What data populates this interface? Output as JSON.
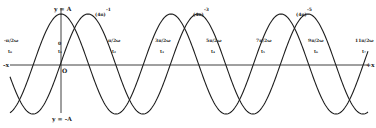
{
  "figure": {
    "type": "displacement-time diagram of two phase-shifted sinusoids",
    "colors": {
      "background": "#ffffff",
      "ink": "#1e1e1e"
    },
    "axes": {
      "x_left_label": "-x",
      "x_right_label": "+x",
      "origin_label": "O",
      "y_top_label": "y = A",
      "y_bottom_label": "y = -A"
    },
    "peak_labels": [
      {
        "text": "(4n)",
        "sup": "-1"
      },
      {
        "text": "(4n)",
        "sup": "-3"
      },
      {
        "text": "(4n)",
        "sup": "-5"
      }
    ],
    "tick_labels": [
      {
        "top": "-π/2ω",
        "bottom": "t₀"
      },
      {
        "top": "0",
        "bottom": "t₁"
      },
      {
        "top": "π/2ω",
        "bottom": "t₂"
      },
      {
        "top": "3π/2ω",
        "bottom": "t₃"
      },
      {
        "top": "5π/2ω",
        "bottom": "t₄"
      },
      {
        "top": "7π/2ω",
        "bottom": "t₅"
      },
      {
        "top": "9π/2ω",
        "bottom": "t₆"
      },
      {
        "top": "11π/2ω",
        "bottom": "t₇"
      }
    ],
    "curves": [
      {
        "name": "curve-1",
        "form": "y = A cos(ωt)",
        "peaks_x_px": [
          61,
          171,
          281
        ],
        "period_px": 110
      },
      {
        "name": "curve-2",
        "form": "y = A cos(ωt - φ)",
        "peaks_x_px": [
          88,
          198,
          308
        ],
        "period_px": 110
      }
    ]
  }
}
